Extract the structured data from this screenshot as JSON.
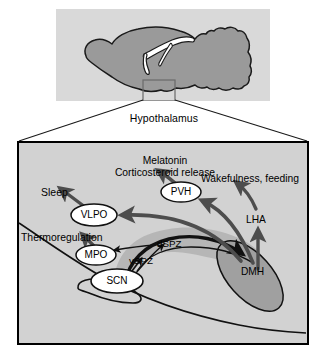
{
  "figure": {
    "caption": "Hypothalamus"
  },
  "top_panel": {
    "name": "sagittal-brain-overview",
    "background_color": "#d9d9d9",
    "brain_fill_color": "#9a9a9a",
    "brain_outline_color": "#1a1a1a",
    "ventricle_color": "#ffffff",
    "inset_box": {
      "label": "hypothalamus-region-box",
      "stroke": "#6a6a6a"
    }
  },
  "lower_panel": {
    "name": "hypothalamus-detail-panel",
    "background_color": "#d2d2d2",
    "border_color": "#000000",
    "nuclei": [
      {
        "id": "PVH",
        "label": "PVH",
        "shape": "ellipse",
        "fill": "#ffffff"
      },
      {
        "id": "VLPO",
        "label": "VLPO",
        "shape": "ellipse",
        "fill": "#ffffff"
      },
      {
        "id": "MPO",
        "label": "MPO",
        "shape": "ellipse",
        "fill": "#ffffff"
      },
      {
        "id": "SCN",
        "label": "SCN",
        "shape": "ellipse",
        "fill": "#ffffff"
      },
      {
        "id": "DMH",
        "label": "DMH",
        "shape": "ellipse",
        "fill": "#a0a0a0"
      },
      {
        "id": "LHA",
        "label": "LHA",
        "shape": "text-only"
      },
      {
        "id": "dSPZ",
        "label": "dSPZ",
        "shape": "text-only"
      },
      {
        "id": "vSPZ",
        "label": "vSPZ",
        "shape": "text-only"
      }
    ],
    "function_labels": [
      {
        "id": "melatonin",
        "text": "Melatonin"
      },
      {
        "id": "cortico",
        "text": "Corticosteroid release"
      },
      {
        "id": "wakefulness",
        "text": "Wakefulness, feeding"
      },
      {
        "id": "sleep",
        "text": "Sleep"
      },
      {
        "id": "thermo",
        "text": "Thermoregulation"
      }
    ],
    "connections": [
      {
        "from": "SCN",
        "to": "vSPZ",
        "style": "thin-black"
      },
      {
        "from": "SCN",
        "to": "dSPZ",
        "style": "thin-black"
      },
      {
        "from": "dSPZ",
        "to": "MPO",
        "style": "thin-black"
      },
      {
        "from": "SPZ",
        "to": "DMH",
        "style": "thick-black"
      },
      {
        "from": "DMH",
        "to": "VLPO",
        "style": "thick-gray"
      },
      {
        "from": "DMH",
        "to": "PVH",
        "style": "thick-gray"
      },
      {
        "from": "DMH",
        "to": "LHA",
        "style": "thick-gray"
      },
      {
        "from": "VLPO",
        "to": "sleep",
        "style": "thick-gray"
      },
      {
        "from": "MPO",
        "to": "thermo",
        "style": "thick-gray"
      },
      {
        "from": "PVH",
        "to": "melatonin",
        "style": "thick-gray"
      },
      {
        "from": "LHA",
        "to": "wakefulness",
        "style": "thick-gray"
      }
    ],
    "spz_band_color": "#b4b4b4",
    "arrow_gray": "#4d4d4d",
    "arrow_black": "#111111"
  }
}
